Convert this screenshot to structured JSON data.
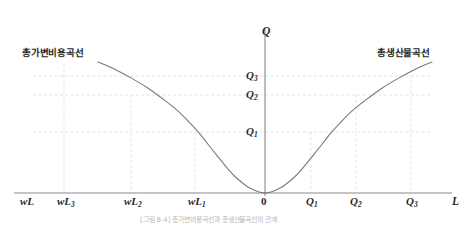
{
  "figure": {
    "background_color": "#ffffff",
    "curve_color": "#7a7a7a",
    "axis_color": "#8a8a8a",
    "grid_color": "#d9d9d9",
    "text_color": "#2b2b2b",
    "caption_text": "[그림 8-4] 총가변비용곡선과 총생산물곡선의 관계"
  },
  "axes": {
    "y_axis_label": "Q",
    "x_axis_label": "L",
    "origin_label": "0"
  },
  "curves": [
    {
      "name": "total-variable-cost-curve",
      "label": "총가변비용곡선",
      "label_x": 22,
      "label_y": 48
    },
    {
      "name": "total-product-curve",
      "label": "총생산물곡선",
      "label_x": 377,
      "label_y": 48
    }
  ],
  "y_ticks": [
    {
      "label": "Q",
      "sub": "3",
      "value": 3,
      "y": 76
    },
    {
      "label": "Q",
      "sub": "2",
      "value": 2,
      "y": 95
    },
    {
      "label": "Q",
      "sub": "1",
      "value": 1,
      "y": 132
    }
  ],
  "x_ticks_left": [
    {
      "label": "wL",
      "sub": "",
      "x": 20,
      "grid": false
    },
    {
      "label": "wL",
      "sub": "3",
      "x": 57,
      "grid": true,
      "grid_x": 64
    },
    {
      "label": "wL",
      "sub": "2",
      "x": 124,
      "grid": true,
      "grid_x": 131
    },
    {
      "label": "wL",
      "sub": "1",
      "x": 188,
      "grid": true,
      "grid_x": 195
    }
  ],
  "x_ticks_right": [
    {
      "label": "Q",
      "sub": "1",
      "x": 306,
      "grid": true,
      "grid_x": 311
    },
    {
      "label": "Q",
      "sub": "2",
      "x": 350,
      "grid": true,
      "grid_x": 356
    },
    {
      "label": "Q",
      "sub": "3",
      "x": 406,
      "grid": true,
      "grid_x": 411
    }
  ],
  "chart_data": {
    "type": "line",
    "title": "",
    "xlabel": "L",
    "ylabel": "Q",
    "grid": true,
    "legend_position": "inline-curve-labels",
    "annotations": [
      "총가변비용곡선",
      "총생산물곡선"
    ],
    "x_tick_labels": [
      "wL",
      "wL3",
      "wL2",
      "wL1",
      "0",
      "Q1",
      "Q2",
      "Q3",
      "L"
    ],
    "y_tick_labels": [
      "Q1",
      "Q2",
      "Q3"
    ],
    "xlim": [
      -10,
      10
    ],
    "ylim": [
      0,
      4
    ],
    "series": [
      {
        "name": "총가변비용곡선",
        "note": "Total variable cost curve, plotted leftward from origin; mirror image of the total product curve",
        "x": [
          -10.0,
          -9.0,
          -8.0,
          -7.0,
          -6.0,
          -5.2,
          -4.6,
          -4.0,
          -3.4,
          -2.8,
          -2.2,
          -1.8,
          -1.4,
          -1.0,
          -0.6,
          -0.3,
          0.0
        ],
        "y": [
          3.65,
          3.45,
          3.2,
          2.92,
          2.58,
          2.28,
          2.0,
          1.7,
          1.35,
          1.0,
          0.66,
          0.46,
          0.3,
          0.16,
          0.07,
          0.02,
          0.0
        ]
      },
      {
        "name": "총생산물곡선",
        "note": "S-shaped total product curve rising from origin to the upper right",
        "x": [
          0.0,
          0.3,
          0.6,
          1.0,
          1.4,
          1.8,
          2.2,
          2.8,
          3.4,
          4.0,
          4.6,
          5.2,
          6.0,
          7.0,
          8.0,
          9.0,
          10.0
        ],
        "y": [
          0.0,
          0.02,
          0.07,
          0.16,
          0.3,
          0.46,
          0.66,
          1.0,
          1.35,
          1.7,
          2.0,
          2.28,
          2.58,
          2.92,
          3.2,
          3.45,
          3.65
        ]
      }
    ],
    "reference_lines": [
      {
        "orientation": "horizontal",
        "label": "Q3",
        "value": 3
      },
      {
        "orientation": "horizontal",
        "label": "Q2",
        "value": 2
      },
      {
        "orientation": "horizontal",
        "label": "Q1",
        "value": 1
      },
      {
        "orientation": "vertical",
        "label": "wL3",
        "value": -8.0
      },
      {
        "orientation": "vertical",
        "label": "wL2",
        "value": -4.6
      },
      {
        "orientation": "vertical",
        "label": "wL1",
        "value": -2.2
      },
      {
        "orientation": "vertical",
        "label": "Q1",
        "value": 2.2
      },
      {
        "orientation": "vertical",
        "label": "Q2",
        "value": 4.6
      },
      {
        "orientation": "vertical",
        "label": "Q3",
        "value": 8.0
      }
    ]
  }
}
